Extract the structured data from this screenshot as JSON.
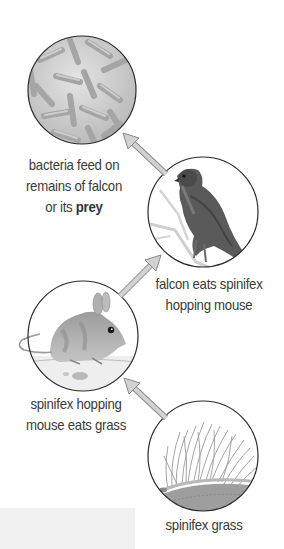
{
  "diagram": {
    "type": "food-chain",
    "colors": {
      "circle_stroke": "#2a2a2a",
      "arrow_fill": "#d2d2d2",
      "arrow_stroke": "#8a8a8a",
      "label_text": "#3a3a3a"
    },
    "nodes": [
      {
        "id": "bacteria",
        "icon": "bacteria-icon",
        "label_lines": [
          "bacteria feed on",
          "remains of falcon"
        ],
        "label_last_prefix": "or its ",
        "label_last_bold": "prey"
      },
      {
        "id": "falcon",
        "icon": "falcon-icon",
        "label_lines": [
          "falcon eats spinifex",
          "hopping mouse"
        ]
      },
      {
        "id": "mouse",
        "icon": "mouse-icon",
        "label_lines": [
          "spinifex hopping",
          "mouse eats grass"
        ]
      },
      {
        "id": "grass",
        "icon": "grass-icon",
        "label_lines": [
          "spinifex grass"
        ]
      }
    ],
    "edges": [
      {
        "from": "grass",
        "to": "mouse"
      },
      {
        "from": "mouse",
        "to": "falcon"
      },
      {
        "from": "falcon",
        "to": "bacteria"
      }
    ]
  }
}
